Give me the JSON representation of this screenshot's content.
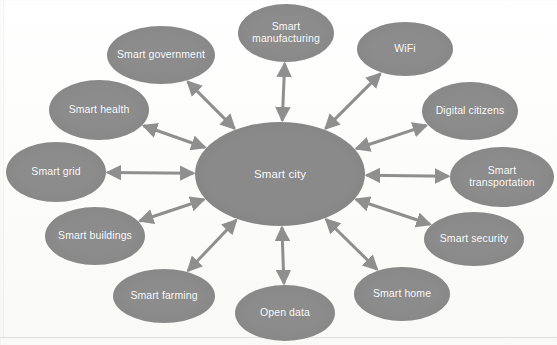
{
  "diagram": {
    "title": "Smart city",
    "center": {
      "label": "Smart city",
      "cx": 280,
      "cy": 174,
      "rx": 85,
      "ry": 52,
      "color": "#8a8a8a",
      "text_color": "#ffffff"
    },
    "node_color": "#8c8c8c",
    "arrow_color": "#8f8f8f",
    "background": "#fdfdfd",
    "arrow_style": "double-headed",
    "nodes": [
      {
        "id": "smart-manufacturing",
        "label": "Smart manufacturing",
        "cx": 286,
        "cy": 33,
        "rx": 48,
        "ry": 29
      },
      {
        "id": "wifi",
        "label": "WiFi",
        "cx": 405,
        "cy": 49,
        "rx": 48,
        "ry": 27
      },
      {
        "id": "digital-citizens",
        "label": "Digital citizens",
        "cx": 470,
        "cy": 111,
        "rx": 48,
        "ry": 29
      },
      {
        "id": "smart-transportation",
        "label": "Smart transportation",
        "cx": 502,
        "cy": 177,
        "rx": 52,
        "ry": 30
      },
      {
        "id": "smart-security",
        "label": "Smart security",
        "cx": 474,
        "cy": 239,
        "rx": 50,
        "ry": 27
      },
      {
        "id": "smart-home",
        "label": "Smart home",
        "cx": 402,
        "cy": 294,
        "rx": 48,
        "ry": 27
      },
      {
        "id": "open-data",
        "label": "Open data",
        "cx": 285,
        "cy": 313,
        "rx": 50,
        "ry": 28
      },
      {
        "id": "smart-farming",
        "label": "Smart farming",
        "cx": 164,
        "cy": 296,
        "rx": 51,
        "ry": 27
      },
      {
        "id": "smart-buildings",
        "label": "Smart buildings",
        "cx": 95,
        "cy": 236,
        "rx": 50,
        "ry": 29
      },
      {
        "id": "smart-grid",
        "label": "Smart grid",
        "cx": 56,
        "cy": 172,
        "rx": 50,
        "ry": 30
      },
      {
        "id": "smart-health",
        "label": "Smart health",
        "cx": 99,
        "cy": 110,
        "rx": 50,
        "ry": 30
      },
      {
        "id": "smart-government",
        "label": "Smart government",
        "cx": 161,
        "cy": 55,
        "rx": 54,
        "ry": 29
      }
    ]
  }
}
